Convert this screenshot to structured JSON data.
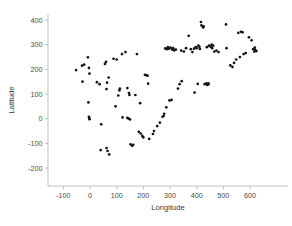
{
  "chart_data": {
    "type": "scatter",
    "title": "",
    "xlabel": "Longitude",
    "ylabel": "Latitude",
    "xlim": [
      -175,
      690
    ],
    "ylim": [
      -260,
      455
    ],
    "grid": false,
    "legend": null,
    "marker": "filled-circle",
    "marker_color": "#141414",
    "xticks": [
      -100,
      0,
      100,
      200,
      300,
      400,
      500,
      600
    ],
    "xtick_labels": [
      "-100",
      "0",
      "100",
      "200",
      "300",
      "400",
      "500",
      "600"
    ],
    "yticks": [
      -200,
      -100,
      0,
      100,
      200,
      300,
      400
    ],
    "ytick_labels": [
      "-200",
      "-100",
      "0",
      "100",
      "200",
      "300",
      "400"
    ],
    "points": [
      [
        -52,
        197
      ],
      [
        -30,
        215
      ],
      [
        -22,
        219
      ],
      [
        -28,
        150
      ],
      [
        -8,
        249
      ],
      [
        -4,
        206
      ],
      [
        -2,
        183
      ],
      [
        -6,
        66
      ],
      [
        -4,
        8
      ],
      [
        -2,
        -2
      ],
      [
        -3,
        3
      ],
      [
        26,
        148
      ],
      [
        36,
        140
      ],
      [
        56,
        222
      ],
      [
        60,
        230
      ],
      [
        64,
        146
      ],
      [
        62,
        120
      ],
      [
        70,
        167
      ],
      [
        42,
        -23
      ],
      [
        40,
        -127
      ],
      [
        62,
        -119
      ],
      [
        66,
        -131
      ],
      [
        72,
        -145
      ],
      [
        88,
        243
      ],
      [
        100,
        240
      ],
      [
        110,
        115
      ],
      [
        106,
        94
      ],
      [
        112,
        122
      ],
      [
        96,
        50
      ],
      [
        120,
        262
      ],
      [
        133,
        270
      ],
      [
        140,
        124
      ],
      [
        146,
        104
      ],
      [
        148,
        96
      ],
      [
        122,
        5
      ],
      [
        140,
        3
      ],
      [
        145,
        0
      ],
      [
        150,
        -3
      ],
      [
        152,
        -104
      ],
      [
        158,
        -110
      ],
      [
        162,
        -106
      ],
      [
        170,
        96
      ],
      [
        176,
        262
      ],
      [
        183,
        -53
      ],
      [
        190,
        -60
      ],
      [
        196,
        -70
      ],
      [
        200,
        -76
      ],
      [
        188,
        63
      ],
      [
        206,
        178
      ],
      [
        212,
        176
      ],
      [
        216,
        174
      ],
      [
        218,
        142
      ],
      [
        222,
        -82
      ],
      [
        236,
        -62
      ],
      [
        240,
        -50
      ],
      [
        252,
        -30
      ],
      [
        262,
        -16
      ],
      [
        272,
        8
      ],
      [
        276,
        11
      ],
      [
        278,
        20
      ],
      [
        282,
        285
      ],
      [
        288,
        282
      ],
      [
        292,
        290
      ],
      [
        296,
        284
      ],
      [
        286,
        46
      ],
      [
        298,
        74
      ],
      [
        302,
        288
      ],
      [
        308,
        280
      ],
      [
        312,
        286
      ],
      [
        306,
        76
      ],
      [
        316,
        277
      ],
      [
        322,
        280
      ],
      [
        330,
        122
      ],
      [
        336,
        140
      ],
      [
        344,
        152
      ],
      [
        342,
        276
      ],
      [
        352,
        272
      ],
      [
        360,
        286
      ],
      [
        370,
        336
      ],
      [
        378,
        282
      ],
      [
        384,
        270
      ],
      [
        390,
        284
      ],
      [
        396,
        290
      ],
      [
        400,
        286
      ],
      [
        406,
        296
      ],
      [
        410,
        292
      ],
      [
        412,
        283
      ],
      [
        416,
        392
      ],
      [
        418,
        378
      ],
      [
        424,
        370
      ],
      [
        426,
        374
      ],
      [
        392,
        106
      ],
      [
        404,
        141
      ],
      [
        430,
        140
      ],
      [
        436,
        143
      ],
      [
        440,
        137
      ],
      [
        444,
        143
      ],
      [
        444,
        140
      ],
      [
        438,
        290
      ],
      [
        446,
        296
      ],
      [
        452,
        292
      ],
      [
        456,
        300
      ],
      [
        458,
        286
      ],
      [
        462,
        296
      ],
      [
        466,
        272
      ],
      [
        474,
        276
      ],
      [
        482,
        270
      ],
      [
        510,
        382
      ],
      [
        512,
        286
      ],
      [
        526,
        216
      ],
      [
        534,
        210
      ],
      [
        540,
        226
      ],
      [
        548,
        240
      ],
      [
        556,
        348
      ],
      [
        566,
        352
      ],
      [
        572,
        350
      ],
      [
        562,
        250
      ],
      [
        576,
        262
      ],
      [
        584,
        266
      ],
      [
        596,
        330
      ],
      [
        606,
        318
      ],
      [
        612,
        282
      ],
      [
        616,
        272
      ],
      [
        620,
        278
      ],
      [
        624,
        274
      ],
      [
        618,
        288
      ]
    ]
  }
}
